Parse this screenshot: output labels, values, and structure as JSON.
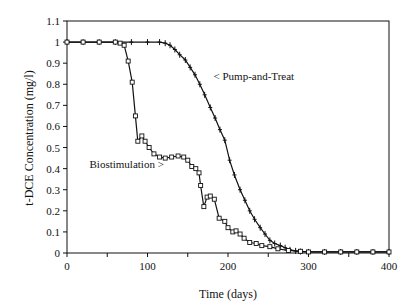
{
  "chart_data": {
    "type": "line",
    "title": "",
    "xlabel": "Time (days)",
    "ylabel": "t-DCE Concentration (mg/l)",
    "xlim": [
      0,
      400
    ],
    "ylim": [
      0,
      1.1
    ],
    "xticks": [
      0,
      100,
      200,
      300,
      400
    ],
    "xminor": [
      50,
      150,
      250,
      350
    ],
    "yticks": [
      0,
      0.1,
      0.2,
      0.3,
      0.4,
      0.5,
      0.6,
      0.7,
      0.8,
      0.9,
      1,
      1.1
    ],
    "ytick_labels": [
      "0",
      "0.1",
      "0.2",
      "0.3",
      "0.4",
      "0.5",
      "0.6",
      "0.7",
      "0.8",
      "0.9",
      "1",
      "1.1"
    ],
    "grid": false,
    "legend": "none (inline annotations)",
    "annotations": [
      {
        "text": "< Pump-and-Treat",
        "x": 182,
        "y": 0.84
      },
      {
        "text": "Biostimulation >",
        "x": 28,
        "y": 0.42
      }
    ],
    "series": [
      {
        "name": "Pump-and-Treat",
        "marker": "plus",
        "x": [
          0,
          20,
          40,
          60,
          80,
          100,
          115,
          122,
          128,
          134,
          140,
          147,
          153,
          159,
          165,
          171,
          178,
          184,
          190,
          196,
          202,
          208,
          215,
          221,
          227,
          233,
          240,
          246,
          252,
          258,
          265,
          271,
          277,
          284,
          290,
          300,
          320,
          340,
          360,
          380,
          400
        ],
        "values": [
          1.0,
          1.0,
          1.0,
          1.0,
          1.0,
          1.0,
          1.0,
          0.995,
          0.985,
          0.965,
          0.94,
          0.915,
          0.88,
          0.845,
          0.8,
          0.75,
          0.69,
          0.64,
          0.585,
          0.535,
          0.44,
          0.37,
          0.3,
          0.25,
          0.2,
          0.16,
          0.12,
          0.09,
          0.06,
          0.045,
          0.035,
          0.025,
          0.015,
          0.01,
          0.007,
          0.005,
          0.005,
          0.005,
          0.005,
          0.005,
          0.005
        ]
      },
      {
        "name": "Biostimulation",
        "marker": "square",
        "x": [
          0,
          20,
          40,
          60,
          66,
          71,
          76,
          81,
          85,
          88,
          93,
          97,
          102,
          108,
          115,
          122,
          130,
          138,
          145,
          150,
          155,
          160,
          164,
          166,
          170,
          174,
          178,
          183,
          189,
          196,
          200,
          206,
          210,
          215,
          220,
          227,
          235,
          242,
          252,
          262,
          275,
          290,
          300,
          320,
          340,
          360,
          380,
          400
        ],
        "values": [
          1.0,
          1.0,
          1.0,
          1.0,
          0.995,
          0.985,
          0.91,
          0.81,
          0.65,
          0.53,
          0.555,
          0.53,
          0.5,
          0.47,
          0.455,
          0.45,
          0.455,
          0.46,
          0.455,
          0.44,
          0.41,
          0.4,
          0.38,
          0.32,
          0.22,
          0.265,
          0.27,
          0.255,
          0.165,
          0.15,
          0.12,
          0.1,
          0.105,
          0.09,
          0.07,
          0.05,
          0.045,
          0.035,
          0.03,
          0.02,
          0.012,
          0.008,
          0.005,
          0.005,
          0.005,
          0.005,
          0.005,
          0.005
        ]
      }
    ]
  }
}
